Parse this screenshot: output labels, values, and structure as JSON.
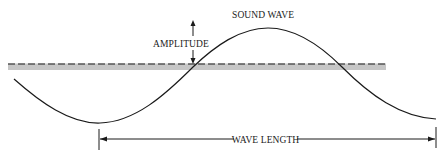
{
  "diagram": {
    "title": "SOUND WAVE",
    "labels": {
      "amplitude": "AMPLITUDE",
      "wave_length": "WAVE LENGTH"
    },
    "colors": {
      "line": "#1a1a1a",
      "band": "#c8c8c8",
      "text": "#222222"
    }
  }
}
